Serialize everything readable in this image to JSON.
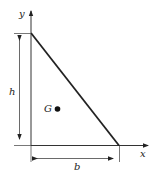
{
  "diagram": {
    "axes": {
      "x_label": "x",
      "y_label": "y"
    },
    "dimensions": {
      "height_label": "h",
      "base_label": "b"
    },
    "centroid": {
      "label": "G"
    },
    "colors": {
      "stroke": "#222222",
      "background": "#ffffff"
    }
  }
}
